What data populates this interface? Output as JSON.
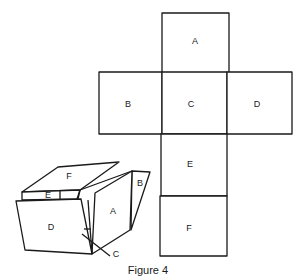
{
  "figure": {
    "caption": "Figure 4",
    "net": {
      "faces": [
        {
          "id": "A",
          "label": "A"
        },
        {
          "id": "B",
          "label": "B"
        },
        {
          "id": "C",
          "label": "C"
        },
        {
          "id": "D",
          "label": "D"
        },
        {
          "id": "E",
          "label": "E"
        },
        {
          "id": "F",
          "label": "F"
        }
      ]
    },
    "box": {
      "faces": [
        {
          "id": "F",
          "label": "F"
        },
        {
          "id": "E",
          "label": "E"
        },
        {
          "id": "D",
          "label": "D"
        },
        {
          "id": "A",
          "label": "A"
        },
        {
          "id": "B",
          "label": "B"
        },
        {
          "id": "C",
          "label": "C"
        }
      ]
    }
  }
}
